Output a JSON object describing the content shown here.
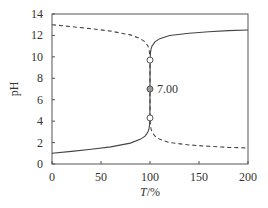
{
  "chart_data": {
    "type": "line",
    "title": "",
    "xlabel": "T/%",
    "ylabel": "pH",
    "xlim": [
      0,
      200
    ],
    "ylim": [
      0,
      14
    ],
    "xticks": [
      0,
      50,
      100,
      150,
      200
    ],
    "yticks": [
      0,
      2,
      4,
      6,
      8,
      10,
      12,
      14
    ],
    "grid": false,
    "legend": null,
    "series": [
      {
        "name": "acid titrated with base",
        "style": "solid",
        "color": "#444444",
        "x": [
          0,
          20,
          40,
          60,
          80,
          90,
          95,
          98,
          99,
          99.5,
          99.9,
          100,
          100.1,
          100.5,
          101,
          102,
          105,
          110,
          120,
          140,
          160,
          180,
          200
        ],
        "y": [
          1.0,
          1.18,
          1.37,
          1.6,
          1.95,
          2.3,
          2.6,
          3.0,
          3.3,
          3.6,
          4.3,
          7.0,
          9.7,
          10.4,
          10.7,
          11.0,
          11.4,
          11.7,
          12.0,
          12.2,
          12.35,
          12.45,
          12.5
        ]
      },
      {
        "name": "base titrated with acid",
        "style": "dashed",
        "color": "#444444",
        "x": [
          0,
          20,
          40,
          60,
          80,
          90,
          95,
          98,
          99,
          99.5,
          99.9,
          100,
          100.1,
          100.5,
          101,
          102,
          105,
          110,
          120,
          140,
          160,
          180,
          200
        ],
        "y": [
          13.0,
          12.82,
          12.63,
          12.4,
          12.05,
          11.7,
          11.4,
          11.0,
          10.7,
          10.4,
          9.7,
          7.0,
          4.3,
          3.6,
          3.3,
          3.0,
          2.6,
          2.3,
          2.0,
          1.78,
          1.65,
          1.55,
          1.5
        ]
      }
    ],
    "markers": [
      {
        "x": 100,
        "y": 9.7,
        "style": "open-circle"
      },
      {
        "x": 100,
        "y": 7.0,
        "style": "filled-circle",
        "label": "7.00"
      },
      {
        "x": 100,
        "y": 4.3,
        "style": "open-circle"
      }
    ],
    "annotations": [
      {
        "text": "7.00",
        "x": 100,
        "y": 7.0
      }
    ]
  }
}
